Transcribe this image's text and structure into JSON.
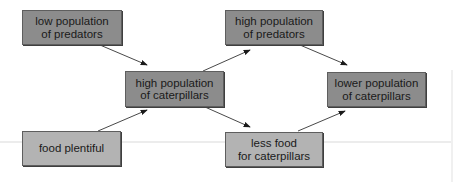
{
  "diagram": {
    "nodes": [
      {
        "id": "low-predators",
        "label_line1": "low population",
        "label_line2": "of predators",
        "style": "dark"
      },
      {
        "id": "high-caterpillars",
        "label_line1": "high population",
        "label_line2": "of caterpillars",
        "style": "dark"
      },
      {
        "id": "food-plentiful",
        "label_line1": "food plentiful",
        "label_line2": "",
        "style": "light"
      },
      {
        "id": "high-predators",
        "label_line1": "high population",
        "label_line2": "of predators",
        "style": "dark"
      },
      {
        "id": "less-food",
        "label_line1": "less food",
        "label_line2": "for caterpillars",
        "style": "light"
      },
      {
        "id": "lower-caterpillars",
        "label_line1": "lower population",
        "label_line2": "of caterpillars",
        "style": "dark"
      }
    ],
    "edges": [
      {
        "from": "low-predators",
        "to": "high-caterpillars"
      },
      {
        "from": "food-plentiful",
        "to": "high-caterpillars"
      },
      {
        "from": "high-caterpillars",
        "to": "high-predators"
      },
      {
        "from": "high-caterpillars",
        "to": "less-food"
      },
      {
        "from": "high-predators",
        "to": "lower-caterpillars"
      },
      {
        "from": "less-food",
        "to": "lower-caterpillars"
      }
    ]
  }
}
